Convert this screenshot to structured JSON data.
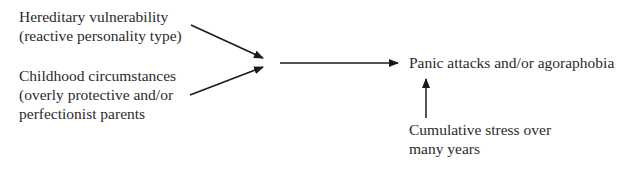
{
  "diagram": {
    "nodes": [
      {
        "id": "hereditary",
        "lines": [
          "Hereditary vulnerability",
          "(reactive personality type)"
        ]
      },
      {
        "id": "childhood",
        "lines": [
          "Childhood circumstances",
          "(overly protective and/or",
          "perfectionist parents"
        ]
      },
      {
        "id": "panic",
        "lines": [
          "Panic attacks and/or agoraphobia"
        ]
      },
      {
        "id": "stress",
        "lines": [
          "Cumulative stress over",
          "many years"
        ]
      }
    ],
    "edges": [
      {
        "from": "hereditary",
        "to": "junction"
      },
      {
        "from": "childhood",
        "to": "junction"
      },
      {
        "from": "junction",
        "to": "panic"
      },
      {
        "from": "stress",
        "to": "panic"
      }
    ],
    "colors": {
      "text": "#2b2b2b",
      "arrow": "#1a1a1a",
      "background": "#ffffff"
    }
  }
}
